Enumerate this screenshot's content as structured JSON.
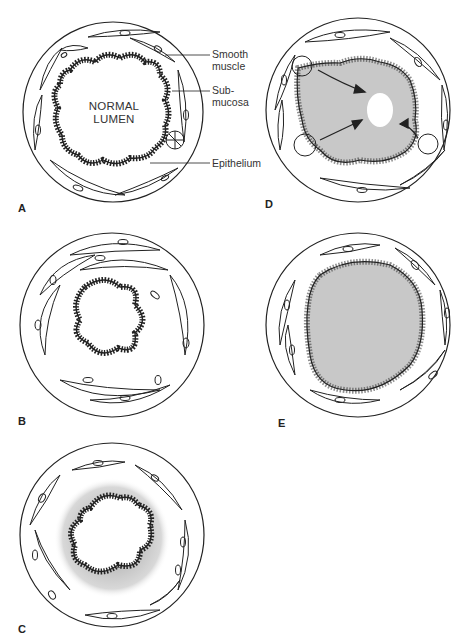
{
  "figure": {
    "panels": [
      {
        "letter": "A",
        "description": "normal airway",
        "lumen_label": [
          "NORMAL",
          "LUMEN"
        ]
      },
      {
        "letter": "B",
        "description": "smooth muscle constriction"
      },
      {
        "letter": "C",
        "description": "submucosal edema"
      },
      {
        "letter": "D",
        "description": "mucus plugging from submucosal glands"
      },
      {
        "letter": "E",
        "description": "lumen filled with secretions"
      }
    ],
    "annotations": [
      {
        "text_line1": "Smooth",
        "text_line2": "muscle"
      },
      {
        "text_line1": "Sub-",
        "text_line2": "mucosa"
      },
      {
        "text_line1": "Epithelium",
        "text_line2": ""
      }
    ],
    "colors": {
      "stroke": "#222222",
      "fill_gray": "#c8c8c8",
      "edema_gray": "#c4c4c4",
      "background": "#ffffff"
    }
  }
}
